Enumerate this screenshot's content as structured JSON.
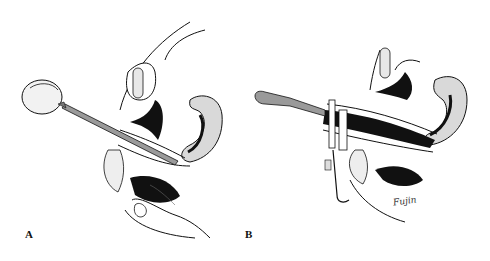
{
  "figure": {
    "panels": [
      {
        "id": "A",
        "label": "A",
        "instrument": "bulb syringe with long cannula"
      },
      {
        "id": "B",
        "label": "B",
        "instrument": "speculum with spatula handle"
      }
    ],
    "signature": "Fujin",
    "colors": {
      "ink": "#111111",
      "shade": "#d9d9d9",
      "background": "#ffffff",
      "instrument": "#9a9a9a"
    }
  }
}
